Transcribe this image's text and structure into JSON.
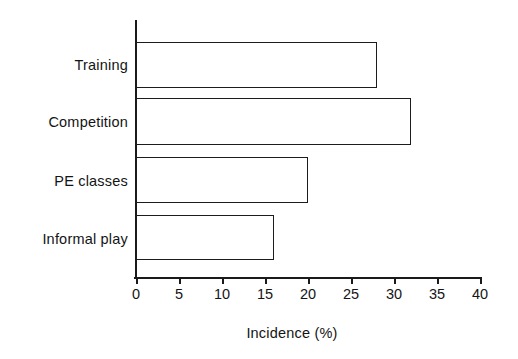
{
  "chart_data": {
    "type": "bar",
    "orientation": "horizontal",
    "title": "",
    "xlabel": "Incidence (%)",
    "ylabel": "",
    "categories": [
      "Training",
      "Competition",
      "PE classes",
      "Informal play"
    ],
    "values": [
      28,
      32,
      20,
      16
    ],
    "xlim": [
      0,
      40
    ],
    "xticks": [
      0,
      5,
      10,
      15,
      20,
      25,
      30,
      35,
      40
    ],
    "xtick_labels": [
      "0",
      "5",
      "10",
      "15",
      "20",
      "25",
      "30",
      "35",
      "40"
    ],
    "grid": false,
    "legend": null,
    "bar_fill": "#ffffff",
    "bar_edge": "#1c1c1c",
    "axis_color": "#1a1a1a",
    "background": "#ffffff"
  }
}
